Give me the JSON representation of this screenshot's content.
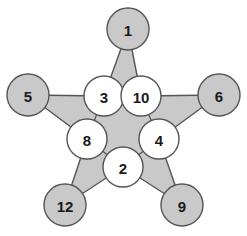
{
  "diagram": {
    "type": "pentagram-star-graph",
    "colors": {
      "star_fill": "#c9c9c9",
      "outer_node_fill": "#c9c9c9",
      "inner_node_fill": "#ffffff",
      "stroke": "#555555",
      "label_color": "#1a1a1a",
      "background": "#ffffff"
    },
    "outer_nodes": [
      {
        "id": "top",
        "label": "1",
        "cx": 128,
        "cy": 29,
        "r": 21
      },
      {
        "id": "left",
        "label": "5",
        "cx": 28,
        "cy": 95,
        "r": 21
      },
      {
        "id": "right",
        "label": "6",
        "cx": 219,
        "cy": 95,
        "r": 21
      },
      {
        "id": "bottom-left",
        "label": "12",
        "cx": 65,
        "cy": 205,
        "r": 21
      },
      {
        "id": "bottom-right",
        "label": "9",
        "cx": 182,
        "cy": 205,
        "r": 21
      }
    ],
    "inner_nodes": [
      {
        "id": "upper-left",
        "label": "3",
        "cx": 104,
        "cy": 96,
        "r": 20
      },
      {
        "id": "upper-right",
        "label": "10",
        "cx": 141,
        "cy": 96,
        "r": 20
      },
      {
        "id": "mid-left",
        "label": "8",
        "cx": 87,
        "cy": 139,
        "r": 20
      },
      {
        "id": "mid-right",
        "label": "4",
        "cx": 159,
        "cy": 139,
        "r": 20
      },
      {
        "id": "bottom",
        "label": "2",
        "cx": 123,
        "cy": 167,
        "r": 20
      }
    ],
    "all_values": [
      1,
      5,
      6,
      12,
      9,
      3,
      10,
      8,
      4,
      2
    ]
  }
}
